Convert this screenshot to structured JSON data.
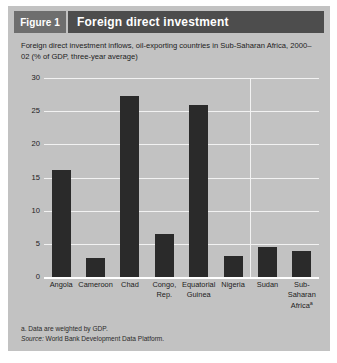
{
  "figure": {
    "badge": "Figure 1",
    "title": "Foreign direct investment"
  },
  "subtitle": "Foreign direct investment inflows, oil-exporting countries in Sub-Saharan Africa, 2000–02 (% of GDP, three-year average)",
  "footnotes": {
    "note_a": "a. Data are weighted by GDP.",
    "source_label": "Source:",
    "source_text": " World Bank Development Data Platform."
  },
  "chart_data": {
    "type": "bar",
    "title": "Foreign direct investment",
    "subtitle": "Foreign direct investment inflows, oil-exporting countries in Sub-Saharan Africa, 2000–02 (% of GDP, three-year average)",
    "xlabel": "",
    "ylabel": "",
    "ylim": [
      0,
      30
    ],
    "yticks": [
      0,
      5,
      10,
      15,
      20,
      25,
      30
    ],
    "ytick_labels": [
      "0",
      "5",
      "10",
      "15",
      "20",
      "25",
      "30"
    ],
    "grid": true,
    "legend": false,
    "bar_color": "#2a2a2a",
    "panel_color": "#c2c2c2",
    "gridline_color": "#f2f2f2",
    "header_color": "#4d4d4d",
    "badge_color": "#6e6e6e",
    "categories": [
      "Angola",
      "Cameroon",
      "Chad",
      "Congo, Rep.",
      "Equatorial Guinea",
      "Nigeria",
      "Sudan",
      "Sub-Saharan Africa"
    ],
    "category_labels": [
      {
        "line1": "Angola",
        "line2": "",
        "line3": "",
        "sup": ""
      },
      {
        "line1": "Cameroon",
        "line2": "",
        "line3": "",
        "sup": ""
      },
      {
        "line1": "Chad",
        "line2": "",
        "line3": "",
        "sup": ""
      },
      {
        "line1": "Congo,",
        "line2": "Rep.",
        "line3": "",
        "sup": ""
      },
      {
        "line1": "Equatorial",
        "line2": "Guinea",
        "line3": "",
        "sup": ""
      },
      {
        "line1": "Nigeria",
        "line2": "",
        "line3": "",
        "sup": ""
      },
      {
        "line1": "Sudan",
        "line2": "",
        "line3": "",
        "sup": ""
      },
      {
        "line1": "Sub-",
        "line2": "Saharan",
        "line3": "Africa",
        "sup": "a"
      }
    ],
    "values": [
      16.2,
      2.8,
      27.3,
      6.5,
      25.9,
      3.1,
      4.6,
      3.9
    ],
    "separator_after_index": 5
  }
}
